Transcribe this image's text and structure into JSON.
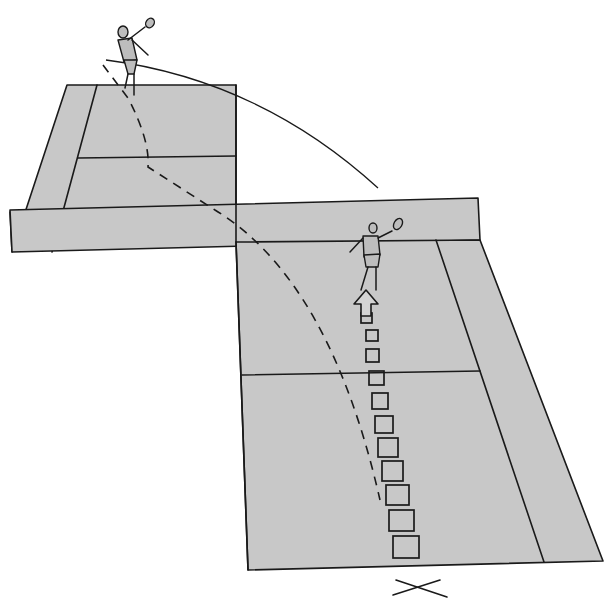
{
  "diagram": {
    "title": "Badminton footwork diagram: player moves forward toward the net while shuttle is hit from the opposite court",
    "colors": {
      "court_fill": "#c8c8c8",
      "line": "#1a1a1a",
      "background": "#ffffff"
    },
    "elements": {
      "far_court": "opponent-half-court",
      "net_band": "net-area",
      "near_court": "player-half-court",
      "far_player": "opponent-player-hitting",
      "near_player": "player-moving-forward",
      "shuttle_path": "solid-arc-shuttle-trajectory",
      "movement_path": "dashed-curved-path",
      "footsteps_count": 11,
      "arrow": "forward-movement-arrow",
      "start_mark": "x-start-mark"
    },
    "labels": {
      "start_mark_glyph": "✕"
    }
  }
}
